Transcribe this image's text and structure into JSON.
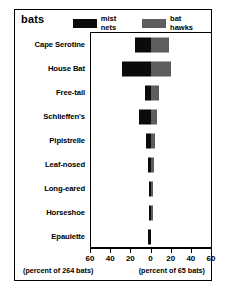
{
  "chart_data": {
    "type": "bar",
    "title": "bats",
    "orientation": "horizontal-diverging",
    "categories": [
      "Cape Serotine",
      "House Bat",
      "Free-tail",
      "Schlieffen's",
      "Pipistrelle",
      "Leaf-nosed",
      "Long-eared",
      "Horseshoe",
      "Epaulette"
    ],
    "series": [
      {
        "name": "mist nets",
        "color": "#0b0b0b",
        "direction": "left",
        "unit": "percent of 264 bats",
        "values": [
          16,
          29,
          6,
          12,
          5,
          3,
          2,
          2.5,
          3
        ]
      },
      {
        "name": "bat hawks",
        "color": "#5e5e5e",
        "direction": "right",
        "unit": "percent of 65 bats",
        "values": [
          17,
          19,
          7,
          5,
          3,
          2,
          1.5,
          1.5,
          0
        ]
      }
    ],
    "xlabel_left": "(percent of 264 bats)",
    "xlabel_right": "(percent of 65 bats)",
    "ylabel": "",
    "xticks": [
      60,
      40,
      20,
      0,
      20,
      40,
      60
    ],
    "xlim": [
      -60,
      60
    ],
    "grid": false,
    "legend_position": "top-right"
  },
  "legend": {
    "items": [
      {
        "label": "mist nets",
        "swatch": "black-swatch"
      },
      {
        "label": "bat hawks",
        "swatch": "gray-swatch"
      }
    ]
  },
  "colors": {
    "mist_nets": "#0b0b0b",
    "bat_hawks": "#5e5e5e",
    "frame": "#000000",
    "background": "#ffffff"
  }
}
